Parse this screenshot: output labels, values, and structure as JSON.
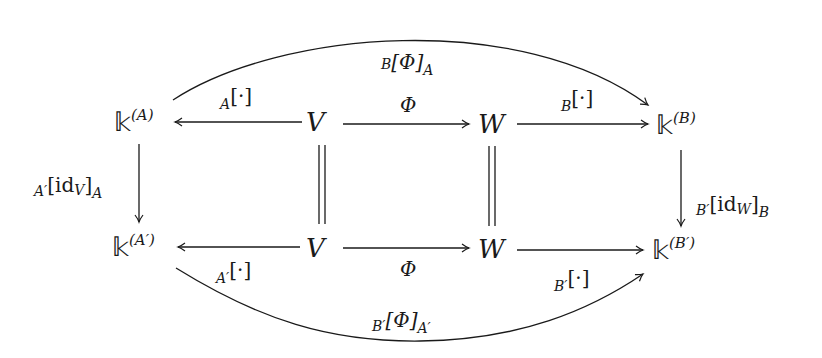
{
  "diagram": {
    "type": "commutative-diagram",
    "nodes": {
      "kA": {
        "base": "𝕜",
        "sup": "(A)"
      },
      "V_top": {
        "label": "V"
      },
      "W_top": {
        "label": "W"
      },
      "kB": {
        "base": "𝕜",
        "sup": "(B)"
      },
      "kA_prime": {
        "base": "𝕜",
        "sup": "(A′)"
      },
      "V_bottom": {
        "label": "V"
      },
      "W_bottom": {
        "label": "W"
      },
      "kB_prime": {
        "base": "𝕜",
        "sup": "(B′)"
      }
    },
    "edges": {
      "top_arc": {
        "pre": "B",
        "main": "[Φ]",
        "post": "A",
        "from": "kA",
        "to": "kB"
      },
      "V_to_kA": {
        "pre": "A",
        "main": "[·]",
        "from": "V_top",
        "to": "kA"
      },
      "V_to_W_top": {
        "main": "Φ",
        "from": "V_top",
        "to": "W_top"
      },
      "W_to_kB": {
        "pre": "B",
        "main": "[·]",
        "from": "W_top",
        "to": "kB"
      },
      "kA_to_kAp": {
        "pre": "A′",
        "main": "[id",
        "mid": "V",
        "close": "]",
        "post": "A",
        "from": "kA",
        "to": "kA_prime"
      },
      "kB_to_kBp": {
        "pre": "B′",
        "main": "[id",
        "mid": "W",
        "close": "]",
        "post": "B",
        "from": "kB",
        "to": "kB_prime"
      },
      "V_equal": {
        "symbol": "="
      },
      "W_equal": {
        "symbol": "="
      },
      "Vp_to_kAp": {
        "pre": "A′",
        "main": "[·]",
        "from": "V_bottom",
        "to": "kA_prime"
      },
      "V_to_W_bottom": {
        "main": "Φ",
        "from": "V_bottom",
        "to": "W_bottom"
      },
      "Wp_to_kBp": {
        "pre": "B′",
        "main": "[·]",
        "from": "W_bottom",
        "to": "kB_prime"
      },
      "bottom_arc": {
        "pre": "B′",
        "main": "[Φ]",
        "post": "A′",
        "from": "kA_prime",
        "to": "kB_prime"
      }
    },
    "colors": {
      "stroke": "#1a1a1a",
      "background": "#ffffff"
    }
  }
}
